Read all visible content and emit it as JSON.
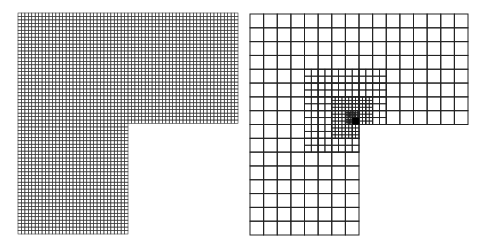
{
  "figure": {
    "panels": [
      {
        "id": "uniform-mesh",
        "description": "Uniform mesh on L-shaped domain",
        "x": 18,
        "y": 13,
        "width": 220,
        "height": 221,
        "divisions": 64,
        "line_color": "#3a3a3a",
        "line_width": 0.6
      },
      {
        "id": "adaptive-mesh",
        "description": "Adaptively refined mesh on L-shaped domain, refined toward re-entrant corner",
        "x": 250,
        "y": 14,
        "width": 218,
        "height": 221,
        "divisions": 16,
        "line_color": "#222222",
        "line_width": 1,
        "refinements": [
          {
            "level": 1,
            "cells": [
              [
                4,
                4,
                6,
                5
              ],
              [
                4,
                9,
                4,
                1
              ]
            ],
            "subdiv": 2
          },
          {
            "level": 2,
            "cells": [
              [
                6,
                6,
                3,
                2
              ],
              [
                6,
                8,
                2,
                1
              ]
            ],
            "subdiv": 4
          },
          {
            "level": 3,
            "cells": [
              [
                7,
                7,
                1,
                1
              ]
            ],
            "subdiv": 8
          }
        ],
        "dark_corner": {
          "cells": [
            [
              7.5,
              7.5,
              0.5,
              0.5
            ]
          ],
          "color": "#000000"
        }
      }
    ]
  }
}
